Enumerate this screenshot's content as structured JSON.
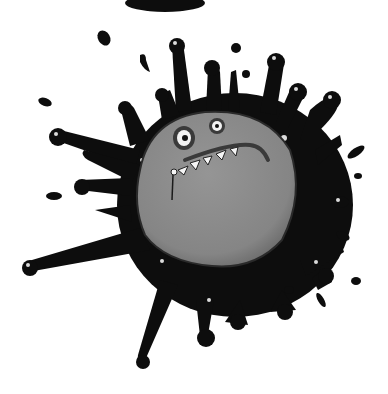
{
  "image": {
    "description": "Cartoon illustration of a grumpy grey round monster face inside a black ink splat",
    "colors": {
      "background": "#ffffff",
      "ink": "#0d0d0d",
      "face": "#8a8a8a",
      "face_shadow": "#5e5e5e",
      "eye_white": "#f2f2f2",
      "teeth": "#f5f5f5"
    }
  }
}
